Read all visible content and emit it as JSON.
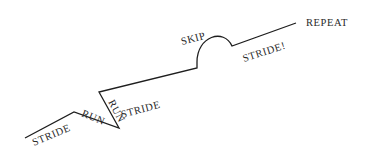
{
  "diagram": {
    "type": "movement-sequence-path",
    "segments": [
      {
        "label": "STRIDE",
        "shape": "rising-line"
      },
      {
        "label": "RUN",
        "shape": "falling-line"
      },
      {
        "label": "RUN",
        "shape": "steep-rising-line"
      },
      {
        "label": "STRIDE",
        "shape": "rising-line"
      },
      {
        "label": "SKIP",
        "shape": "arc"
      },
      {
        "label": "STRIDE!",
        "shape": "rising-line"
      }
    ],
    "end_label": "REPEAT",
    "line_color": "#1e1e1e",
    "text_color": "#2a2a2a"
  }
}
